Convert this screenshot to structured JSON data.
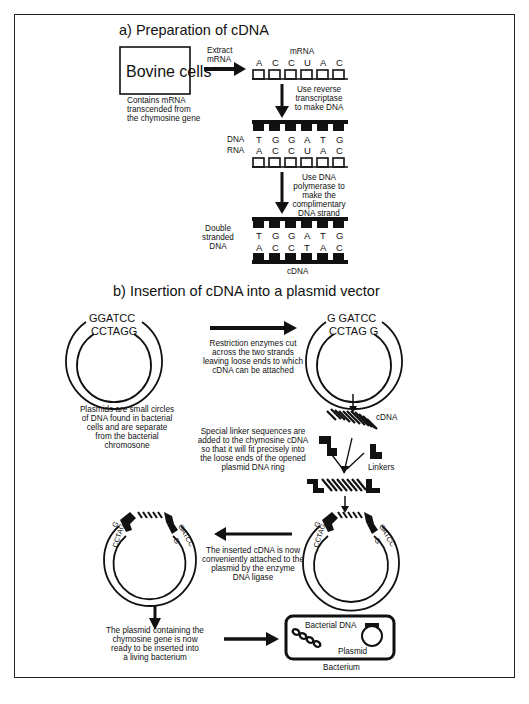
{
  "section_a": {
    "title": "a) Preparation of cDNA",
    "cell_box_label": "Bovine cells",
    "cell_caption": [
      "Contains mRNA",
      "transcended from",
      "the chymosine gene"
    ],
    "extract_label": [
      "Extract",
      "mRNA"
    ],
    "mrna_label": "mRNA",
    "mrna_bases": [
      "A",
      "C",
      "C",
      "U",
      "A",
      "C"
    ],
    "step1_label": [
      "Use reverse",
      "transcriptase",
      "to make DNA"
    ],
    "hybrid_dna_label": "DNA",
    "hybrid_rna_label": "RNA",
    "hybrid_dna_bases": [
      "T",
      "G",
      "G",
      "A",
      "T",
      "G"
    ],
    "hybrid_rna_bases": [
      "A",
      "C",
      "C",
      "U",
      "A",
      "C"
    ],
    "step2_label": [
      "Use DNA",
      "polymerase to",
      "make the",
      "complimentary",
      "DNA strand"
    ],
    "ds_label": [
      "Double",
      "stranded",
      "DNA"
    ],
    "ds_top_bases": [
      "T",
      "G",
      "G",
      "A",
      "T",
      "G"
    ],
    "ds_bottom_bases": [
      "A",
      "C",
      "C",
      "T",
      "A",
      "C"
    ],
    "cdna_label": "cDNA"
  },
  "section_b": {
    "title": "b) Insertion of cDNA into a plasmid vector",
    "plasmid1_top": "GGATCC",
    "plasmid1_bottom": "CCTAGG",
    "plasmid1_caption": [
      "Plasmids are small circles",
      "of DNA found in bacterial",
      "cells and are separate",
      "from the bacterial",
      "chromosone"
    ],
    "restriction_caption": [
      "Restriction enzymes cut",
      "across the two strands",
      "leaving loose ends to which",
      "cDNA can be attached"
    ],
    "plasmid2_top": "G  GATCC",
    "plasmid2_bottom": "CCTAG  G",
    "cdna_label": "cDNA",
    "linker_caption": [
      "Special linker sequences are",
      "added to the chymosine cDNA",
      "so that it will fit precisely into",
      "the loose ends of the opened",
      "plasmid DNA ring"
    ],
    "linkers_label": "Linkers",
    "ligase_caption": [
      "The inserted cDNA is now",
      "conveniently attached to the",
      "plasmid by the enzyme",
      "DNA ligase"
    ],
    "end_left_small": "CCTAG",
    "end_left_g": "G",
    "end_right_small": "GATCC",
    "end_right_g": "G",
    "final_caption": [
      "The plasmid containing the",
      "chymosine gene is now",
      "ready to be inserted into",
      "a living bacterium"
    ],
    "bacterial_dna_label": "Bacterial DNA",
    "plasmid_label": "Plasmid",
    "bacterium_label": "Bacterium"
  },
  "colors": {
    "ink": "#111111",
    "background": "#ffffff",
    "frame": "#222222"
  }
}
